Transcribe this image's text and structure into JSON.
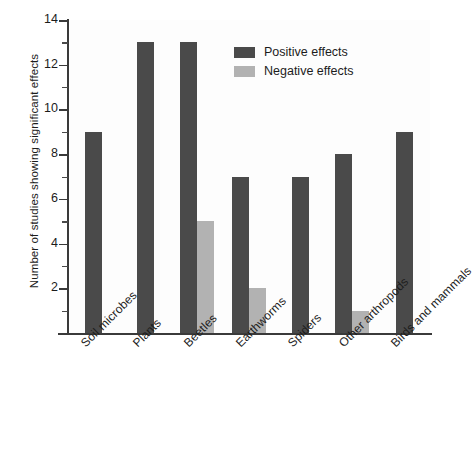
{
  "chart_data": {
    "type": "bar",
    "title": "",
    "subtitle": "",
    "xlabel": "",
    "ylabel": "Number of studies showing significant effects",
    "categories": [
      "Soil microbes",
      "Plants",
      "Beetles",
      "Earthworms",
      "Spiders",
      "Other arthropods",
      "Birds and mammals"
    ],
    "series": [
      {
        "name": "Positive effects",
        "color": "#4a4a4a",
        "values": [
          9,
          13,
          13,
          7,
          7,
          8,
          9
        ]
      },
      {
        "name": "Negative effects",
        "color": "#b2b2b2",
        "values": [
          0,
          0,
          5,
          2,
          0,
          1,
          0
        ]
      }
    ],
    "ylim": [
      0,
      14
    ],
    "ytick_labels": [
      "14",
      "12",
      "10",
      "8",
      "6",
      "4",
      "2"
    ],
    "ytick_values": [
      14,
      12,
      10,
      8,
      6,
      4,
      2
    ],
    "yminor_tick_values": [
      13,
      11,
      9,
      7,
      5,
      3,
      1
    ],
    "grid": false,
    "legend_position": "top-right",
    "xtick_label_rotation": -45
  },
  "legend": {
    "entries": [
      {
        "label": "Positive effects",
        "color": "#4a4a4a"
      },
      {
        "label": "Negative effects",
        "color": "#b2b2b2"
      }
    ]
  }
}
